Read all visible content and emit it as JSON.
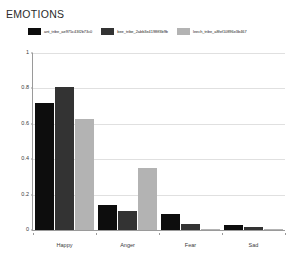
{
  "chart_data": {
    "type": "bar",
    "title": "EMOTIONS",
    "xlabel": "",
    "ylabel": "",
    "ylim": [
      0,
      1
    ],
    "yticks": [
      "0",
      "0.2",
      "0.4",
      "0.6",
      "0.8",
      "1"
    ],
    "ytick_values": [
      0,
      0.2,
      0.4,
      0.6,
      0.8,
      1
    ],
    "grid": true,
    "legend_position": "top-center",
    "categories": [
      "Happy",
      "Anger",
      "Fear",
      "Sad"
    ],
    "series": [
      {
        "name": "ant_tribe_ae975c43f2b73c0",
        "color": "#0d0d0d",
        "values": [
          0.72,
          0.14,
          0.09,
          0.03
        ]
      },
      {
        "name": "bee_tribe_2abb3e4198ff3b9b",
        "color": "#333333",
        "values": [
          0.81,
          0.11,
          0.035,
          0.015
        ]
      },
      {
        "name": "leech_tribe_a8fef10896e3b467",
        "color": "#b3b3b3",
        "values": [
          0.63,
          0.35,
          0.008,
          0.008
        ]
      }
    ]
  },
  "colors": {
    "background": "#ffffff",
    "axis": "#9a9a9a",
    "gridline": "#e0e0e0",
    "title_text": "#2b2b2b",
    "tick_text": "#3a3a3a"
  }
}
